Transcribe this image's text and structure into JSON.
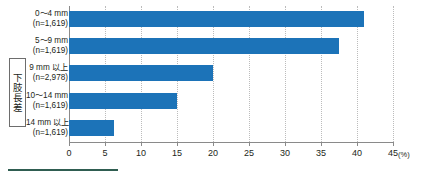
{
  "chart_data": {
    "type": "bar",
    "orientation": "horizontal",
    "title": "",
    "xlabel": "(%)",
    "ylabel": "下肢長差",
    "xlim": [
      0,
      45
    ],
    "xticks": [
      0,
      5,
      10,
      15,
      20,
      25,
      30,
      35,
      40,
      45
    ],
    "xtick_labels": [
      "0",
      "5",
      "10",
      "15",
      "20",
      "25",
      "30",
      "35",
      "40",
      "45"
    ],
    "grid": true,
    "legend": "none",
    "bar_color": "#1c73b8",
    "axis_color": "#8a8a8a",
    "grid_color": "#bcbcbc",
    "categories": [
      "0〜4 mm",
      "5〜9 mm",
      "9 mm 以上",
      "10〜14 mm",
      "14 mm 以上"
    ],
    "category_sublabels": [
      "(n=1,619)",
      "(n=1,619)",
      "(n=2,978)",
      "(n=1,619)",
      "(n=1,619)"
    ],
    "values": [
      41.0,
      37.5,
      20.0,
      15.0,
      6.3
    ]
  },
  "group_label": {
    "text": "下肢長差"
  },
  "axis": {
    "unit_label": "(%)"
  }
}
